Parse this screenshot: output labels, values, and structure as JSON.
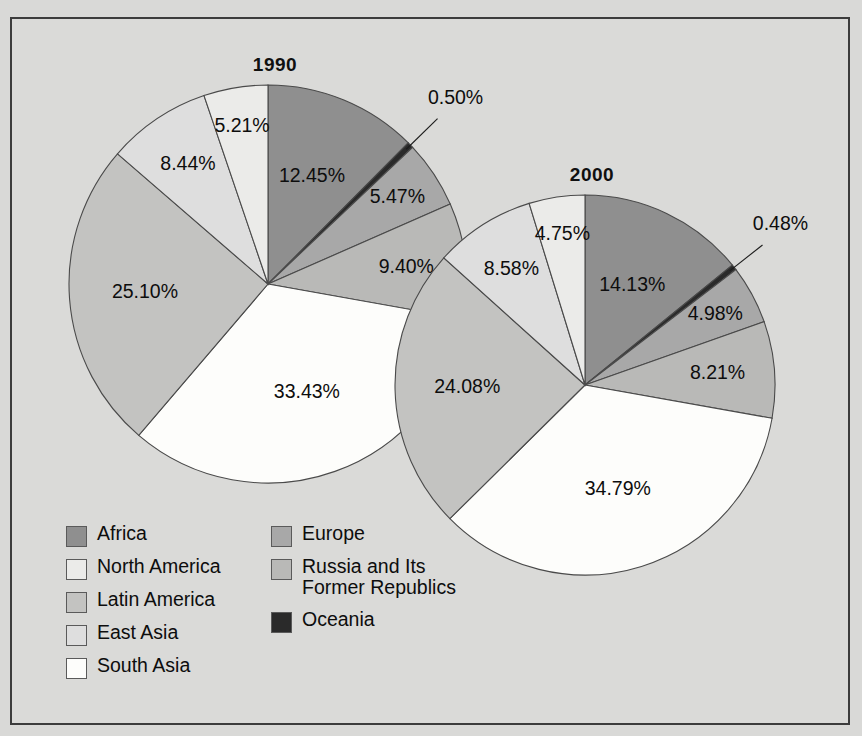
{
  "chart_data": {
    "type": "pie",
    "title": "",
    "charts": [
      {
        "title": "1990",
        "cx": 268,
        "cy": 284,
        "r": 199,
        "labels": [
          "Africa",
          "Oceania",
          "Europe",
          "Russia and Its Former Republics",
          "South Asia",
          "Latin America",
          "East Asia",
          "North America"
        ],
        "values": [
          12.45,
          0.5,
          5.47,
          9.4,
          33.43,
          25.1,
          8.44,
          5.21
        ],
        "value_labels": [
          "12.45%",
          "0.50%",
          "5.47%",
          "9.40%",
          "33.43%",
          "25.10%",
          "8.44%",
          "5.21%"
        ]
      },
      {
        "title": "2000",
        "cx": 585,
        "cy": 385,
        "r": 190,
        "labels": [
          "Africa",
          "Oceania",
          "Europe",
          "Russia and Its Former Republics",
          "South Asia",
          "Latin America",
          "East Asia",
          "North America"
        ],
        "values": [
          14.13,
          0.48,
          4.98,
          8.21,
          34.79,
          24.08,
          8.58,
          4.75
        ],
        "value_labels": [
          "14.13%",
          "0.48%",
          "4.98%",
          "8.21%",
          "34.79%",
          "24.08%",
          "8.58%",
          "4.75%"
        ]
      }
    ],
    "legend": {
      "position": "bottom-left",
      "columns": [
        [
          {
            "label": "Africa",
            "color": "#8f8f8f"
          },
          {
            "label": "North America",
            "color": "#ebebe9"
          },
          {
            "label": "Latin America",
            "color": "#c3c3c1"
          },
          {
            "label": "East Asia",
            "color": "#dedede"
          },
          {
            "label": "South Asia",
            "color": "#fdfdfb"
          }
        ],
        [
          {
            "label": "Europe",
            "color": "#a8a8a8"
          },
          {
            "label": "Russia and Its\nFormer Republics",
            "color": "#b9b9b7"
          },
          {
            "label": "Oceania",
            "color": "#2a2a2a"
          }
        ]
      ]
    },
    "colors": {
      "africa": "#8f8f8f",
      "north_america": "#ebebe9",
      "latin_america": "#c3c3c1",
      "east_asia": "#dedede",
      "south_asia": "#fdfdfb",
      "europe": "#a8a8a8",
      "russia": "#b9b9b7",
      "oceania": "#2a2a2a",
      "background": "#d9d9d7",
      "frame": "#3c3c3c",
      "text": "#0d0d0d"
    },
    "grid": false,
    "xlabel": "",
    "ylabel": ""
  }
}
